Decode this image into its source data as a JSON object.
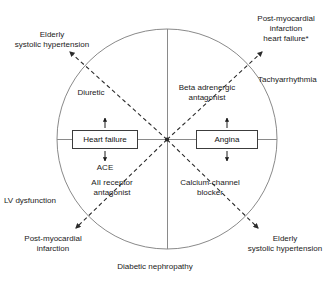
{
  "diagram": {
    "type": "clinical-indication-wheel",
    "style": {
      "line_color": "#7a7a7a",
      "dash_color": "#2b2b2b",
      "box_border_color": "#3c3c3c",
      "text_color": "#1a1a1a",
      "background": "#ffffff"
    },
    "circle": {
      "cx": 167,
      "cy": 139,
      "r": 110
    },
    "center_boxes": [
      {
        "id": "heart-failure",
        "label": "Heart failure",
        "x": 72,
        "y": 130,
        "w": 66,
        "h": 19
      },
      {
        "id": "angina",
        "label": "Angina",
        "x": 196,
        "y": 130,
        "w": 62,
        "h": 19
      }
    ],
    "box_sublabels": [
      {
        "id": "ace",
        "label": "ACE"
      }
    ],
    "drug_labels": [
      {
        "id": "diuretic",
        "label": "Diuretic",
        "quadrant": "upper-left"
      },
      {
        "id": "beta-adrenergic-antagonist",
        "label": "Beta adrenergic\nantagonist",
        "quadrant": "upper-right"
      },
      {
        "id": "aii-receptor-antagonist",
        "label": "AII receptor\nantagonist",
        "quadrant": "lower-left"
      },
      {
        "id": "calcium-channel-blocker",
        "label": "Calcium-channel\nblocker",
        "quadrant": "lower-right"
      }
    ],
    "outer_labels": [
      {
        "id": "elderly-systolic-hypertension-top-left",
        "label": "Elderly\nsystolic hypertension",
        "position": "top-left"
      },
      {
        "id": "post-mi-heart-failure-top-right",
        "label": "Post-myocardial\ninfarction\nheart failure*",
        "position": "top-right"
      },
      {
        "id": "tachyarrhythmia",
        "label": "Tachyarrhythmia",
        "position": "right"
      },
      {
        "id": "lv-dysfunction",
        "label": "LV dysfunction",
        "position": "left"
      },
      {
        "id": "post-mi-bottom-left",
        "label": "Post-myocardial\ninfarction",
        "position": "bottom-left"
      },
      {
        "id": "elderly-systolic-hypertension-bottom-right",
        "label": "Elderly\nsystolic hypertension",
        "position": "bottom-right"
      },
      {
        "id": "diabetic-nephropathy",
        "label": "Diabetic nephropathy",
        "position": "bottom"
      }
    ]
  }
}
